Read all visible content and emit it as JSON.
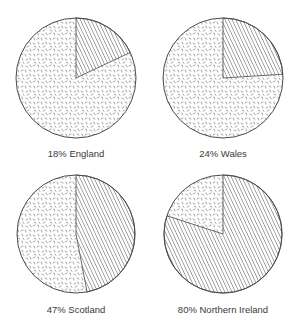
{
  "chart_data": {
    "type": "pie",
    "title": "",
    "layout": "2x2 grid of pie charts",
    "legend": null,
    "pies": [
      {
        "label": "18% England",
        "region": "England",
        "percent": 18,
        "slices": [
          {
            "name": "hatched",
            "value": 18
          },
          {
            "name": "speckled",
            "value": 82
          }
        ]
      },
      {
        "label": "24% Wales",
        "region": "Wales",
        "percent": 24,
        "slices": [
          {
            "name": "hatched",
            "value": 24
          },
          {
            "name": "speckled",
            "value": 76
          }
        ]
      },
      {
        "label": "47% Scotland",
        "region": "Scotland",
        "percent": 47,
        "slices": [
          {
            "name": "hatched",
            "value": 47
          },
          {
            "name": "speckled",
            "value": 53
          }
        ]
      },
      {
        "label": "80% Northern Ireland",
        "region": "Northern Ireland",
        "percent": 80,
        "slices": [
          {
            "name": "hatched",
            "value": 80
          },
          {
            "name": "speckled",
            "value": 20
          }
        ]
      }
    ]
  },
  "style": {
    "outline_color": "#4a4a4a",
    "hatch_color": "#555555",
    "speckle_color": "#6a6a6a",
    "label_color": "#3a3a3a"
  },
  "labels": {
    "pie_0": "18% England",
    "pie_1": "24% Wales",
    "pie_2": "47% Scotland",
    "pie_3": "80% Northern Ireland"
  }
}
